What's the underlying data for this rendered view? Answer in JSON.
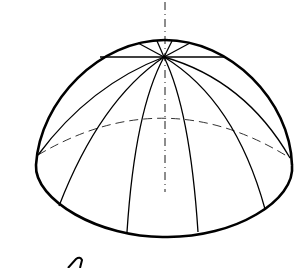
{
  "figure": {
    "colors": {
      "background": "#ffffff",
      "stroke": "#000000",
      "hidden_line": "#555555"
    },
    "meridian_count": 12
  }
}
